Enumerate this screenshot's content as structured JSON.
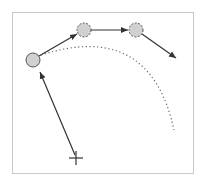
{
  "diagram": {
    "frame": {
      "x": 12,
      "y": 12,
      "w": 181,
      "h": 161,
      "stroke": "#c8c8c8"
    },
    "colors": {
      "node_fill": "#d0d0d0",
      "node_stroke": "#555555",
      "edge": "#333333",
      "dotted_path": "#666666",
      "cross": "#333333"
    },
    "nodes": [
      {
        "id": "start",
        "style": "solid",
        "cx": 33,
        "cy": 60,
        "r": 7
      },
      {
        "id": "step-1",
        "style": "dashed",
        "cx": 84,
        "cy": 30,
        "r": 7
      },
      {
        "id": "step-2",
        "style": "dashed",
        "cx": 136,
        "cy": 30,
        "r": 7
      }
    ],
    "edges": [
      {
        "from": "start",
        "x1": 39,
        "y1": 56,
        "x2": 77,
        "y2": 34
      },
      {
        "from": "step-1",
        "x1": 91,
        "y1": 30,
        "x2": 128,
        "y2": 30
      },
      {
        "from": "step-2",
        "x1": 142,
        "y1": 34,
        "x2": 176,
        "y2": 58
      },
      {
        "from": "cross",
        "x1": 75,
        "y1": 155,
        "x2": 40,
        "y2": 72
      }
    ],
    "dotted_path": {
      "d": "M 41 55 Q 150 20 174 130"
    },
    "cross_marker": {
      "cx": 76,
      "cy": 158,
      "size": 7
    }
  }
}
